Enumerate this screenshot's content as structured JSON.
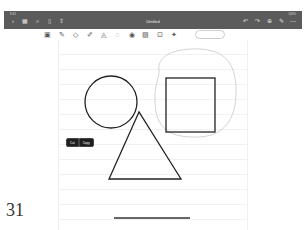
{
  "status_bar": {
    "time": "9:41",
    "indicators": "100%"
  },
  "topbar": {
    "title": "Untitled",
    "left_icons": [
      {
        "name": "back-icon",
        "glyph": "‹"
      },
      {
        "name": "grid-icon",
        "glyph": "▦"
      },
      {
        "name": "search-icon",
        "glyph": "⌕"
      },
      {
        "name": "bookmark-icon",
        "glyph": "▯"
      },
      {
        "name": "share-icon",
        "glyph": "⇪"
      }
    ],
    "right_icons": [
      {
        "name": "undo-icon",
        "glyph": "↶"
      },
      {
        "name": "redo-icon",
        "glyph": "↷"
      },
      {
        "name": "add-page-icon",
        "glyph": "⊕"
      },
      {
        "name": "pen-mode-icon",
        "glyph": "✎"
      },
      {
        "name": "more-icon",
        "glyph": "⋯"
      }
    ]
  },
  "tools": [
    {
      "name": "read-mode-icon",
      "glyph": "▣"
    },
    {
      "name": "pen-icon",
      "glyph": "✎"
    },
    {
      "name": "eraser-icon",
      "glyph": "◇"
    },
    {
      "name": "highlighter-icon",
      "glyph": "✐"
    },
    {
      "name": "shapes-icon",
      "glyph": "◬"
    },
    {
      "name": "lasso-icon",
      "glyph": "◌"
    },
    {
      "name": "sticker-icon",
      "glyph": "◉"
    },
    {
      "name": "image-icon",
      "glyph": "▨"
    },
    {
      "name": "text-box-icon",
      "glyph": "⊡"
    },
    {
      "name": "laser-pointer-icon",
      "glyph": "✦"
    }
  ],
  "context_menu": {
    "items": [
      "Cut",
      "Copy"
    ]
  },
  "page_number": "31",
  "colors": {
    "topbar": "#5b5b5b",
    "stroke": "#222222",
    "lasso": "#c8c8c8"
  }
}
